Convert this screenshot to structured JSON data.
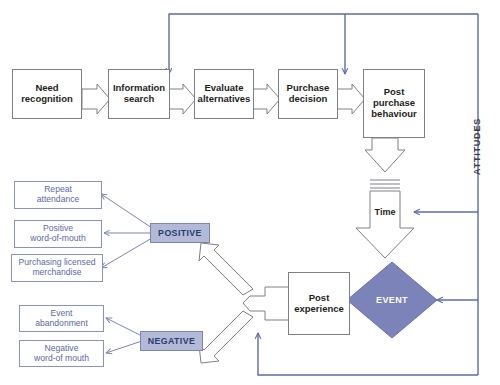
{
  "diagram": {
    "colors": {
      "flow_border": "#7f8086",
      "flow_text": "#1d1d20",
      "outcome_border": "#8a93be",
      "outcome_text": "#5b68a4",
      "valence_fill": "#b3bad8",
      "valence_text": "#2e3a6b",
      "event_fill": "#7b83b8",
      "event_text": "#ffffff",
      "feedback_line": "#5c6ba8",
      "hollow_arrow_stroke": "#7f8086"
    },
    "main_flow": [
      {
        "id": "need-recognition",
        "label": "Need\nrecognition"
      },
      {
        "id": "information-search",
        "label": "Information\nsearch"
      },
      {
        "id": "evaluate-alternatives",
        "label": "Evaluate\nalternatives"
      },
      {
        "id": "purchase-decision",
        "label": "Purchase\ndecision"
      },
      {
        "id": "post-purchase-behaviour",
        "label": "Post\npurchase\nbehaviour"
      }
    ],
    "time_node": {
      "id": "time",
      "label": "Time"
    },
    "event_node": {
      "id": "event",
      "label": "EVENT"
    },
    "post_experience": {
      "id": "post-experience",
      "label": "Post\nexperience"
    },
    "attitudes_spine": {
      "id": "attitudes",
      "label": "ATTITUDES"
    },
    "valence": {
      "positive": {
        "id": "positive",
        "label": "POSITIVE"
      },
      "negative": {
        "id": "negative",
        "label": "NEGATIVE"
      }
    },
    "positive_outcomes": [
      {
        "id": "repeat-attendance",
        "label": "Repeat\nattendance"
      },
      {
        "id": "positive-word-of-mouth",
        "label": "Positive\nword-of-mouth"
      },
      {
        "id": "purchasing-licensed-merchandise",
        "label": "Purchasing licensed\nmerchandise"
      }
    ],
    "negative_outcomes": [
      {
        "id": "event-abandonment",
        "label": "Event\nabandonment"
      },
      {
        "id": "negative-word-of-mouth",
        "label": "Negative\nword-of mouth"
      }
    ]
  }
}
